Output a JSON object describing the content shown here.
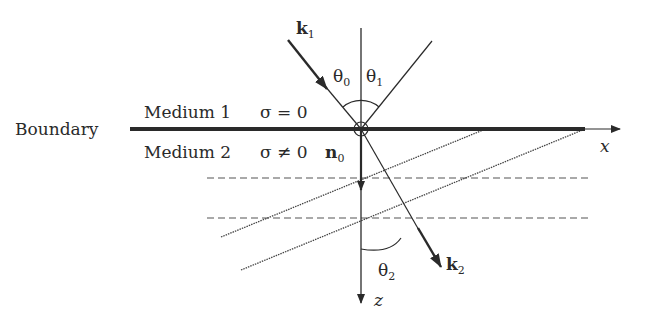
{
  "labels": {
    "boundary": "Boundary",
    "medium1": "Medium 1",
    "medium2": "Medium 2",
    "sigma1": "σ = 0",
    "sigma2": "σ ≠ 0",
    "k1": "k",
    "k1_sub": "1",
    "k2": "k",
    "k2_sub": "2",
    "n0": "n",
    "n0_sub": "0",
    "theta0": "θ",
    "theta0_sub": "0",
    "theta1": "θ",
    "theta1_sub": "1",
    "theta2": "θ",
    "theta2_sub": "2",
    "x_axis": "x",
    "z_axis": "z"
  },
  "colors": {
    "ink": "#2a2a2a",
    "background": "#ffffff"
  }
}
